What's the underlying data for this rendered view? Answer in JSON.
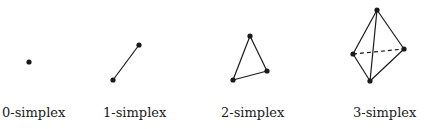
{
  "diagram": {
    "background": "#ffffff",
    "stroke_color": "#1a1a1a",
    "simplices": [
      {
        "label": "0-simplex",
        "label_x": 2,
        "vertices": [
          [
            29,
            62
          ]
        ],
        "edges": [],
        "dashed_edges": []
      },
      {
        "label": "1-simplex",
        "label_x": 103,
        "vertices": [
          [
            113,
            80
          ],
          [
            139,
            45
          ]
        ],
        "edges": [
          [
            0,
            1
          ]
        ],
        "dashed_edges": []
      },
      {
        "label": "2-simplex",
        "label_x": 221,
        "vertices": [
          [
            250,
            36
          ],
          [
            233,
            80
          ],
          [
            267,
            71
          ]
        ],
        "edges": [
          [
            0,
            1
          ],
          [
            1,
            2
          ],
          [
            2,
            0
          ]
        ],
        "dashed_edges": []
      },
      {
        "label": "3-simplex",
        "label_x": 353,
        "vertices": [
          [
            377,
            10
          ],
          [
            353,
            54
          ],
          [
            404,
            49
          ],
          [
            370,
            81
          ]
        ],
        "edges": [
          [
            0,
            1
          ],
          [
            0,
            2
          ],
          [
            0,
            3
          ],
          [
            1,
            3
          ],
          [
            2,
            3
          ]
        ],
        "dashed_edges": [
          [
            1,
            2
          ]
        ]
      }
    ]
  }
}
